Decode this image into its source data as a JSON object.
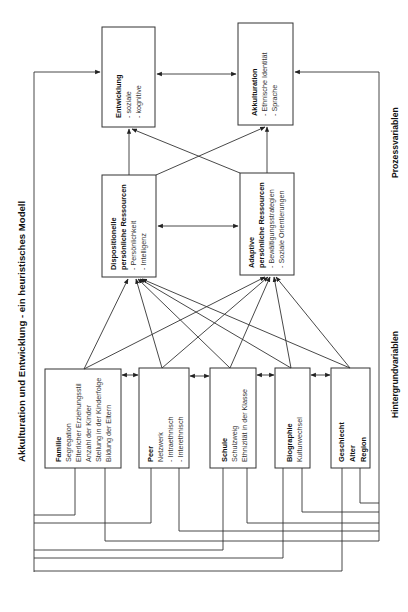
{
  "title": "Akkulturation und Entwicklung - ein heuristisches Modell",
  "labels": {
    "process": "Prozessvariablen",
    "background": "Hintergrundvariablen"
  },
  "outcomes": {
    "entwicklung": {
      "title": "Entwicklung",
      "items": [
        "- soziale",
        "- kognitive"
      ]
    },
    "akkulturation": {
      "title": "Akkulturation",
      "items": [
        "- Ethnische Identität",
        "- Sprache"
      ]
    }
  },
  "resources": {
    "dispositionell": {
      "title1": "Dispositionelle",
      "title2": "persönliche Ressourcen",
      "items": [
        "- Persönlichkeit",
        "- Intelligenz"
      ]
    },
    "adaptiv": {
      "title1": "Adaptive",
      "title2": "persönliche Ressourcen",
      "items": [
        "- Bewältigungsstrategien",
        "- Soziale Orientierungen"
      ]
    }
  },
  "background": {
    "familie": {
      "title": "Familie",
      "items": [
        "Segregation",
        "Elterlicher Erziehungsstil",
        "Anzahl der Kinder",
        "Stellung in der Kinderfolge",
        "Bildung der Eltern"
      ]
    },
    "peer": {
      "title": "Peer",
      "items": [
        "Netzwerk",
        "- Intraethnisch",
        "- Interethnisch"
      ]
    },
    "schule": {
      "title": "Schule",
      "items": [
        "Schulzweig",
        "Ethnizität in der Klasse"
      ]
    },
    "biographie": {
      "title": "Biographie",
      "items": [
        "Kulturwechsel"
      ]
    },
    "geschlecht": {
      "title1": "Geschlecht",
      "title2": "Alter",
      "title3": "Region"
    }
  }
}
